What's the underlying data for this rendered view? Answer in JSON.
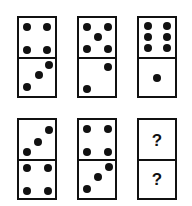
{
  "puzzle": {
    "dominoes": [
      {
        "row": 0,
        "col": 0,
        "top": 4,
        "bottom": 3
      },
      {
        "row": 0,
        "col": 1,
        "top": 5,
        "bottom": 2
      },
      {
        "row": 0,
        "col": 2,
        "top": 6,
        "bottom": 1
      },
      {
        "row": 1,
        "col": 0,
        "top": 3,
        "bottom": 4
      },
      {
        "row": 1,
        "col": 1,
        "top": 4,
        "bottom": 3
      },
      {
        "row": 1,
        "col": 2,
        "top": "?",
        "bottom": "?"
      }
    ],
    "unknown_top": "?",
    "unknown_bottom": "?"
  }
}
